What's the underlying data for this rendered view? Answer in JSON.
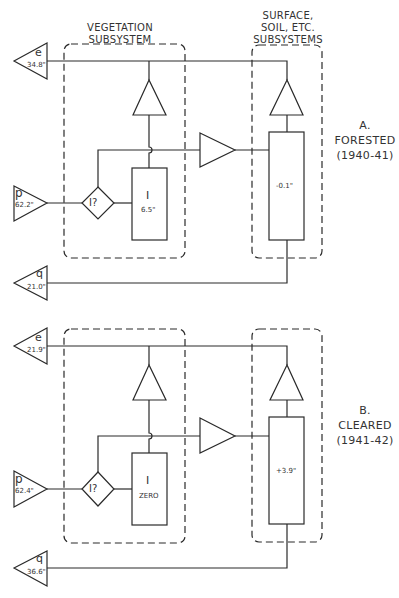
{
  "headers": {
    "vegetation": [
      "VEGETATION",
      "SUBSYSTEM"
    ],
    "surface": [
      "SURFACE,",
      "SOIL, ETC.",
      "SUBSYSTEMS"
    ]
  },
  "panels": [
    {
      "id": "A",
      "label_letter": "A.",
      "label_name": "FORESTED",
      "label_years": "(1940-41)",
      "evaporation": {
        "symbol": "e",
        "value": "34.8\""
      },
      "precipitation": {
        "symbol": "p",
        "value": "62.2\""
      },
      "runoff": {
        "symbol": "q",
        "value": "21.0\""
      },
      "decision": "I?",
      "interception": {
        "symbol": "I",
        "value": "6.5\""
      },
      "storage_change": "-0.1\""
    },
    {
      "id": "B",
      "label_letter": "B.",
      "label_name": "CLEARED",
      "label_years": "(1941-42)",
      "evaporation": {
        "symbol": "e",
        "value": "21.9\""
      },
      "precipitation": {
        "symbol": "p",
        "value": "62.4\""
      },
      "runoff": {
        "symbol": "q",
        "value": "36.6\""
      },
      "decision": "I?",
      "interception": {
        "symbol": "I",
        "value": "ZERO"
      },
      "storage_change": "+3.9\""
    }
  ],
  "colors": {
    "line": "#2a2a2a",
    "background": "#ffffff"
  }
}
